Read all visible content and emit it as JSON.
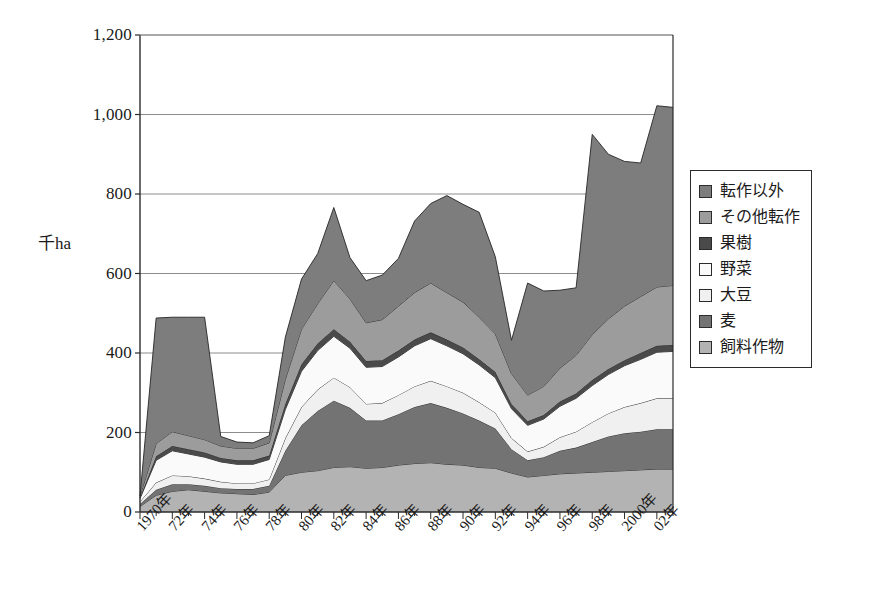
{
  "chart_data": {
    "type": "area",
    "title": "",
    "xlabel": "",
    "ylabel": "千ha",
    "ylim": [
      0,
      1200
    ],
    "ytick_values": [
      0,
      200,
      400,
      600,
      800,
      1000,
      1200
    ],
    "ytick_labels": [
      "0",
      "200",
      "400",
      "600",
      "800",
      "1,000",
      "1,200"
    ],
    "grid": true,
    "legend_position": "right",
    "stacked": true,
    "stack_order_bottom_to_top": [
      "飼料作物",
      "麦",
      "大豆",
      "野菜",
      "果樹",
      "その他転作",
      "転作以外"
    ],
    "categories": [
      "1970年",
      "1971年",
      "72年",
      "1973年",
      "74年",
      "1975年",
      "76年",
      "1977年",
      "78年",
      "1979年",
      "80年",
      "1981年",
      "82年",
      "1983年",
      "84年",
      "1985年",
      "86年",
      "1987年",
      "88年",
      "1989年",
      "90年",
      "1991年",
      "92年",
      "1993年",
      "94年",
      "1995年",
      "96年",
      "1997年",
      "98年",
      "1999年",
      "2000年",
      "2001年",
      "02年",
      "2003年"
    ],
    "xtick_labels_shown": [
      "1970年",
      "72年",
      "74年",
      "76年",
      "78年",
      "80年",
      "82年",
      "84年",
      "86年",
      "88年",
      "90年",
      "92年",
      "94年",
      "96年",
      "98年",
      "2000年",
      "02年"
    ],
    "series": [
      {
        "name": "飼料作物",
        "color": "#b3b3b3",
        "values": [
          14,
          42,
          52,
          56,
          52,
          48,
          46,
          44,
          50,
          92,
          100,
          104,
          112,
          114,
          110,
          112,
          118,
          122,
          124,
          120,
          118,
          112,
          110,
          98,
          88,
          92,
          96,
          98,
          100,
          102,
          104,
          106,
          108,
          108
        ]
      },
      {
        "name": "麦",
        "color": "#737373",
        "values": [
          6,
          14,
          18,
          14,
          14,
          12,
          12,
          14,
          16,
          62,
          118,
          150,
          168,
          148,
          120,
          118,
          128,
          142,
          150,
          142,
          130,
          118,
          100,
          60,
          42,
          46,
          58,
          64,
          76,
          88,
          94,
          96,
          100,
          100
        ]
      },
      {
        "name": "大豆",
        "color": "#f0f0f0",
        "values": [
          6,
          18,
          22,
          20,
          18,
          16,
          14,
          14,
          16,
          32,
          46,
          54,
          58,
          52,
          42,
          44,
          48,
          52,
          56,
          54,
          52,
          46,
          40,
          28,
          22,
          26,
          34,
          40,
          50,
          58,
          66,
          72,
          78,
          78
        ]
      },
      {
        "name": "野菜",
        "color": "#fafafa",
        "values": [
          8,
          56,
          62,
          56,
          54,
          50,
          48,
          48,
          50,
          72,
          90,
          98,
          104,
          98,
          92,
          92,
          96,
          102,
          106,
          102,
          98,
          94,
          88,
          74,
          66,
          70,
          78,
          84,
          92,
          98,
          104,
          110,
          116,
          118
        ]
      },
      {
        "name": "果樹",
        "color": "#4a4a4a",
        "values": [
          2,
          10,
          12,
          12,
          12,
          10,
          10,
          10,
          10,
          14,
          18,
          18,
          18,
          16,
          16,
          16,
          16,
          16,
          16,
          16,
          16,
          14,
          14,
          12,
          10,
          10,
          12,
          12,
          14,
          14,
          14,
          16,
          16,
          16
        ]
      },
      {
        "name": "その他転作",
        "color": "#9c9c9c",
        "values": [
          4,
          32,
          36,
          34,
          32,
          30,
          30,
          30,
          32,
          62,
          88,
          100,
          122,
          108,
          96,
          102,
          112,
          118,
          124,
          118,
          114,
          106,
          96,
          76,
          66,
          72,
          84,
          96,
          114,
          126,
          136,
          142,
          148,
          150
        ]
      },
      {
        "name": "転作以外",
        "color": "#7d7d7d",
        "values": [
          0,
          316,
          288,
          298,
          308,
          24,
          16,
          14,
          18,
          106,
          126,
          126,
          184,
          104,
          106,
          112,
          120,
          180,
          200,
          244,
          246,
          264,
          194,
          84,
          282,
          240,
          196,
          170,
          504,
          414,
          364,
          336,
          456,
          448
        ]
      }
    ],
    "totals": [
      40,
      488,
      490,
      490,
      490,
      190,
      176,
      174,
      192,
      440,
      586,
      650,
      766,
      640,
      582,
      596,
      638,
      732,
      776,
      796,
      774,
      754,
      642,
      432,
      576,
      556,
      558,
      564,
      950,
      900,
      882,
      878,
      1022,
      1018
    ]
  },
  "legend": {
    "items": [
      {
        "label": "転作以外",
        "color": "#7d7d7d"
      },
      {
        "label": "その他転作",
        "color": "#9c9c9c"
      },
      {
        "label": "果樹",
        "color": "#4a4a4a"
      },
      {
        "label": "野菜",
        "color": "#fafafa"
      },
      {
        "label": "大豆",
        "color": "#f0f0f0"
      },
      {
        "label": "麦",
        "color": "#737373"
      },
      {
        "label": "飼料作物",
        "color": "#b3b3b3"
      }
    ]
  }
}
